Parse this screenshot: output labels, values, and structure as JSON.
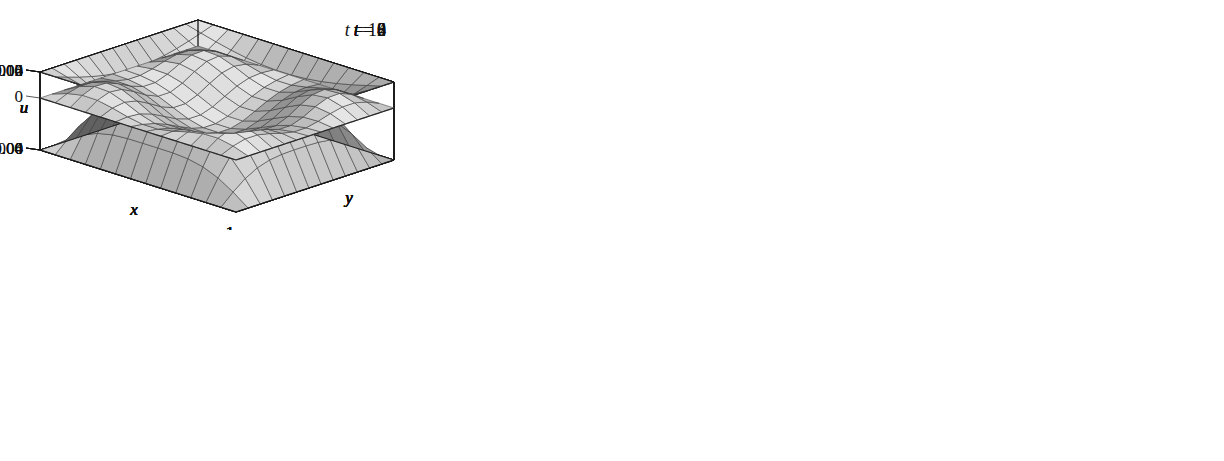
{
  "figure": {
    "kind": "surface-plot-grid",
    "rows": 2,
    "cols": 3,
    "background": "#ffffff",
    "ink": "#111111",
    "surface_fill_light": "#d8d8d8",
    "surface_fill_mid": "#b0b0b0",
    "surface_fill_dark": "#8a8a8a",
    "mesh_color": "#3a3a3a"
  },
  "chart_data": {
    "type": "surface",
    "title": "",
    "xlabel": "x",
    "ylabel": "y",
    "zlabel": "u",
    "xlim": [
      0,
      1
    ],
    "ylim": [
      0,
      1
    ],
    "x_ticks": [
      "1"
    ],
    "y_ticks": [
      "1"
    ],
    "grid": true,
    "legend": "none",
    "mesh_nx": 13,
    "mesh_ny": 13,
    "panels": [
      {
        "id": "t0",
        "label": "t = 0",
        "label_var": "t",
        "label_eq": "=",
        "label_val": "0",
        "zlabel": "u",
        "xlabel": "x",
        "ylabel": "y",
        "z_ticks": [
          "0.06",
          "0"
        ],
        "z_tick_values": [
          0.06,
          0
        ],
        "zlim": [
          0,
          0.06
        ],
        "x_tick": "1",
        "y_tick": "1",
        "shape": "dome",
        "amplitude": 0.0625,
        "modes": [
          {
            "m": 1,
            "n": 1,
            "a": 1.0
          }
        ],
        "description": "single positive dome, maximum near centre"
      },
      {
        "id": "t2",
        "label": "t = 2",
        "label_var": "t",
        "label_eq": "=",
        "label_val": "2",
        "zlabel": "u",
        "xlabel": "x",
        "ylabel": "y",
        "z_ticks": [
          "0",
          "-0.06"
        ],
        "z_tick_values": [
          0,
          -0.06
        ],
        "zlim": [
          -0.06,
          0
        ],
        "x_tick": "1",
        "y_tick": "1",
        "shape": "bowl",
        "amplitude": -0.058,
        "modes": [
          {
            "m": 1,
            "n": 1,
            "a": 1.0
          }
        ],
        "description": "single negative basin, minimum near centre"
      },
      {
        "id": "t4",
        "label": "t = 4",
        "label_var": "t",
        "label_eq": "=",
        "label_val": "4",
        "zlabel": "u",
        "xlabel": "x",
        "ylabel": "y",
        "z_ticks": [
          "0.04",
          "0"
        ],
        "z_tick_values": [
          0.04,
          0
        ],
        "zlim": [
          0,
          0.04
        ],
        "x_tick": "1",
        "y_tick": "1",
        "shape": "dome",
        "amplitude": 0.042,
        "modes": [
          {
            "m": 1,
            "n": 1,
            "a": 1.0
          }
        ],
        "description": "single positive dome, slightly lower than t = 0"
      },
      {
        "id": "t6",
        "label": "t = 6",
        "label_var": "t",
        "label_eq": "=",
        "label_val": "6",
        "zlabel": "u",
        "xlabel": "x",
        "ylabel": "y",
        "z_ticks": [
          "0",
          "-0.04"
        ],
        "z_tick_values": [
          0,
          -0.04
        ],
        "zlim": [
          -0.04,
          0
        ],
        "x_tick": "1",
        "y_tick": "1",
        "shape": "bowl",
        "amplitude": -0.038,
        "modes": [
          {
            "m": 1,
            "n": 1,
            "a": 1.0
          }
        ],
        "description": "shallow negative basin"
      },
      {
        "id": "t8",
        "label": "t = 8",
        "label_var": "t",
        "label_eq": "=",
        "label_val": "8",
        "zlabel": "u",
        "xlabel": "x",
        "ylabel": "y",
        "z_ticks": [
          "0.015",
          "0"
        ],
        "z_tick_values": [
          0.015,
          0
        ],
        "zlim": [
          0,
          0.015
        ],
        "x_tick": "1",
        "y_tick": "1",
        "shape": "dome-rippled",
        "amplitude": 0.0155,
        "modes": [
          {
            "m": 1,
            "n": 1,
            "a": 1.0
          },
          {
            "m": 3,
            "n": 1,
            "a": 0.16
          },
          {
            "m": 1,
            "n": 3,
            "a": 0.14
          }
        ],
        "description": "broad positive plateau with small ripples on the crest"
      },
      {
        "id": "t10",
        "label": "t = 10",
        "label_var": "t",
        "label_eq": "=",
        "label_val": "10",
        "zlabel": "u",
        "xlabel": "x",
        "ylabel": "y",
        "z_ticks": [
          "0.002",
          "0",
          "-0.004"
        ],
        "z_tick_values": [
          0.002,
          0,
          -0.004
        ],
        "zlim": [
          -0.004,
          0.002
        ],
        "x_tick": "1",
        "y_tick": "1",
        "shape": "saddle-multimode",
        "amplitude": 0.002,
        "modes": [
          {
            "m": 1,
            "n": 1,
            "a": -0.55
          },
          {
            "m": 3,
            "n": 1,
            "a": 0.62
          },
          {
            "m": 1,
            "n": 3,
            "a": 0.55
          },
          {
            "m": 3,
            "n": 3,
            "a": 0.3
          }
        ],
        "description": "mixed higher modes: raised rims with a central depression"
      }
    ]
  }
}
